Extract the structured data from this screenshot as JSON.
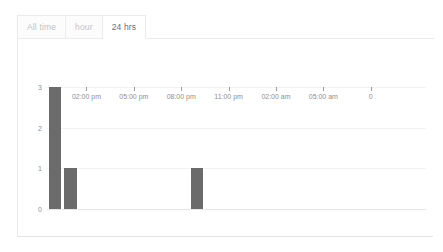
{
  "tabs": [
    {
      "label": "All time",
      "active": false
    },
    {
      "label": "hour",
      "active": false
    },
    {
      "label": "24 hrs",
      "active": true
    }
  ],
  "colors": {
    "bar": "#6b6b6b",
    "grid": "#f2f2f4",
    "axis_text": "#8e8e94",
    "tab_inactive_text": "#c2c2c8",
    "tab_active_text": "#6d6d73",
    "card_border": "#e9e9ec"
  },
  "chart_data": {
    "type": "bar",
    "title": "",
    "xlabel": "",
    "ylabel": "",
    "ylim": [
      0,
      3
    ],
    "yticks": [
      "0",
      "1",
      "2",
      "3"
    ],
    "grid": true,
    "legend": null,
    "xticks": [
      "02:00 pm",
      "05:00 pm",
      "08:00 pm",
      "11:00 pm",
      "02:00 am",
      "05:00 am",
      "0"
    ],
    "categories": [
      "12:00 pm",
      "01:00 pm",
      "02:00 pm",
      "03:00 pm",
      "04:00 pm",
      "05:00 pm",
      "06:00 pm",
      "07:00 pm",
      "08:00 pm",
      "09:00 pm",
      "10:00 pm",
      "11:00 pm",
      "12:00 am",
      "01:00 am",
      "02:00 am",
      "03:00 am",
      "04:00 am",
      "05:00 am",
      "06:00 am",
      "07:00 am",
      "08:00 am",
      "09:00 am",
      "10:00 am",
      "11:00 am"
    ],
    "values": [
      3,
      1,
      0,
      0,
      0,
      0,
      0,
      0,
      0,
      1,
      0,
      0,
      0,
      0,
      0,
      0,
      0,
      0,
      0,
      0,
      0,
      0,
      0,
      0
    ]
  }
}
